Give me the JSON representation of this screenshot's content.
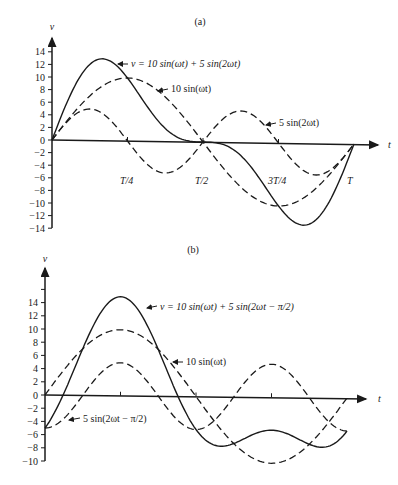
{
  "chart_data": [
    {
      "type": "line",
      "title": "(a)",
      "xlabel": "t",
      "ylabel": "v",
      "ylim": [
        -14,
        14
      ],
      "yticks": [
        14,
        12,
        10,
        8,
        6,
        4,
        2,
        0,
        -2,
        -4,
        -6,
        -8,
        -10,
        -12,
        -14
      ],
      "ytick_labels": [
        "14",
        "12",
        "10",
        "8",
        "6",
        "4",
        "2",
        "0",
        "−2",
        "−4",
        "−6",
        "−8",
        "−10",
        "−12",
        "−14"
      ],
      "xticks": [
        "T/4",
        "T/2",
        "3T/4",
        "T"
      ],
      "grid": false,
      "series": [
        {
          "name": "v = 10 sin(ωt) + 5 sin(2ωt)",
          "style": "solid",
          "formula": "10*sin(wt)+5*sin(2wt)",
          "peak": 12.9,
          "min": -12.9
        },
        {
          "name": "10 sin(ωt)",
          "style": "dashed",
          "formula": "10*sin(wt)",
          "peak": 10,
          "min": -10
        },
        {
          "name": "5 sin(2ωt)",
          "style": "dashed",
          "formula": "5*sin(2wt)",
          "peak": 5,
          "min": -5
        }
      ],
      "annotations": [
        {
          "text": "v = 10 sin(ωt) + 5 sin(2ωt)"
        },
        {
          "text": "10 sin(ωt)"
        },
        {
          "text": "5 sin(2ωt)"
        }
      ]
    },
    {
      "type": "line",
      "title": "(b)",
      "xlabel": "t",
      "ylabel": "v",
      "ylim": [
        -10,
        16
      ],
      "yticks": [
        14,
        12,
        10,
        8,
        6,
        4,
        2,
        0,
        -2,
        -4,
        -6,
        -8,
        -10
      ],
      "ytick_labels": [
        "14",
        "12",
        "10",
        "8",
        "6",
        "4",
        "2",
        "0",
        "−2",
        "−4",
        "−6",
        "−8",
        "−10"
      ],
      "xticks": [
        "T/4",
        "T/2",
        "3T/4",
        "T"
      ],
      "grid": false,
      "series": [
        {
          "name": "v = 10 sin(ωt) + 5 sin(2ωt − π/2)",
          "style": "solid",
          "formula": "10*sin(wt)+5*sin(2wt-pi/2)",
          "peak": 15,
          "min": -8
        },
        {
          "name": "10 sin(ωt)",
          "style": "dashed",
          "formula": "10*sin(wt)",
          "peak": 10,
          "min": -10
        },
        {
          "name": "5 sin(2ωt − π/2)",
          "style": "dashed",
          "formula": "5*sin(2wt-pi/2)",
          "peak": 5,
          "min": -5
        }
      ],
      "annotations": [
        {
          "text": "v = 10 sin(ωt) + 5 sin(2ωt − π/2)"
        },
        {
          "text": "10 sin(ωt)"
        },
        {
          "text": "5 sin(2ωt − π/2)"
        }
      ]
    }
  ],
  "panels": {
    "a": {
      "title": "(a)",
      "y_axis_label": "v",
      "x_axis_label": "t",
      "x_tick_labels": [
        "T/4",
        "T/2",
        "3T/4",
        "T"
      ],
      "labels": {
        "sum": "v = 10 sin(ωt) + 5 sin(2ωt)",
        "fund": "10 sin(ωt)",
        "harm": "5 sin(2ωt)"
      }
    },
    "b": {
      "title": "(b)",
      "y_axis_label": "v",
      "x_axis_label": "t",
      "labels": {
        "sum": "v = 10 sin(ωt) + 5 sin(2ωt − π/2)",
        "fund": "10 sin(ωt)",
        "harm": "5 sin(2ωt − π/2)"
      }
    }
  },
  "colors": {
    "ink": "#1a1a1a",
    "background": "#ffffff"
  }
}
